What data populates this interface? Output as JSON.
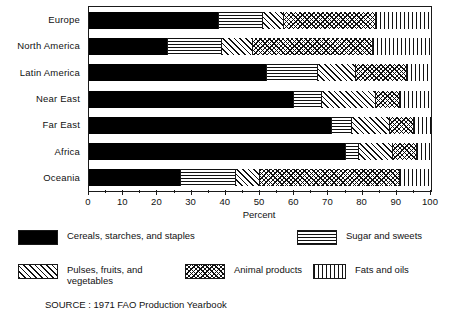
{
  "chart_data": {
    "type": "bar",
    "orientation": "horizontal",
    "stacked": true,
    "percent_stacked": true,
    "title": "",
    "xlabel": "Percent",
    "ylabel": "",
    "xlim": [
      0,
      100
    ],
    "xticks": [
      0,
      10,
      20,
      30,
      40,
      50,
      60,
      70,
      80,
      90,
      100
    ],
    "xtick_labels": [
      "0",
      "10",
      "20",
      "30",
      "40",
      "50",
      "60",
      "70",
      "80",
      "90",
      "100"
    ],
    "grid": false,
    "legend_position": "bottom",
    "categories": [
      "Europe",
      "North America",
      "Latin America",
      "Near East",
      "Far East",
      "Africa",
      "Oceania"
    ],
    "series": [
      {
        "name": "Cereals, starches, and staples",
        "pattern": "solid-black",
        "values": [
          38,
          23,
          52,
          60,
          71,
          75,
          27
        ]
      },
      {
        "name": "Sugar and sweets",
        "pattern": "horizontal-lines",
        "values": [
          13,
          16,
          15,
          8,
          6,
          4,
          16
        ]
      },
      {
        "name": "Pulses, fruits, and vegetables",
        "pattern": "diagonal-hatch",
        "values": [
          6,
          9,
          11,
          16,
          11,
          10,
          7
        ]
      },
      {
        "name": "Animal products",
        "pattern": "cross-hatch",
        "values": [
          27,
          35,
          15,
          7,
          7,
          7,
          41
        ]
      },
      {
        "name": "Fats and oils",
        "pattern": "vertical-lines",
        "values": [
          16,
          17,
          7,
          9,
          5,
          4,
          9
        ]
      }
    ],
    "source": "SOURCE : 1971 FAO Production Yearbook"
  },
  "axis": {
    "xlabel": "Percent"
  },
  "legend": {
    "items": [
      {
        "label": "Cereals, starches, and staples",
        "pattern": "solid-black"
      },
      {
        "label": "Sugar and sweets",
        "pattern": "horizontal-lines"
      },
      {
        "label": "Pulses, fruits, and\nvegetables",
        "pattern": "diagonal-hatch"
      },
      {
        "label": "Animal products",
        "pattern": "cross-hatch"
      },
      {
        "label": "Fats and oils",
        "pattern": "vertical-lines"
      }
    ]
  },
  "footer": {
    "source": "SOURCE : 1971 FAO Production Yearbook"
  },
  "colors": {
    "ink": "#111111",
    "paper": "#ffffff"
  }
}
